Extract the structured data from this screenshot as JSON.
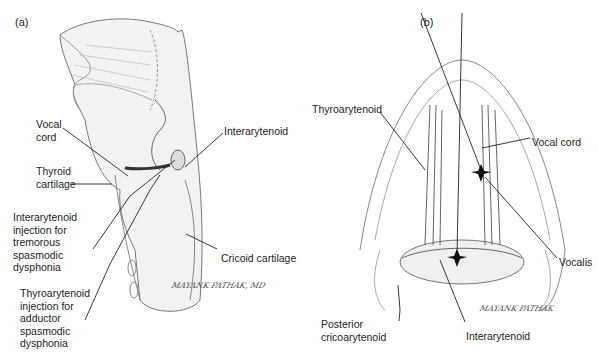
{
  "panels": {
    "a": {
      "label": "(a)",
      "labels": {
        "vocal_cord": [
          "Vocal",
          "cord"
        ],
        "thyroid_cartilage": [
          "Thyroid",
          "cartilage"
        ],
        "interarytenoid": "Interarytenoid",
        "interarytenoid_injection": [
          "Interarytenoid",
          "injection for",
          "tremorous",
          "spasmodic",
          "dysphonia"
        ],
        "thyroarytenoid_injection": [
          "Thyroarytenoid",
          "injection for",
          "adductor",
          "spasmodic",
          "dysphonia"
        ],
        "cricoid_cartilage": "Cricoid cartilage"
      },
      "signature": "MAYANK PATHAK, MD"
    },
    "b": {
      "label": "(b)",
      "labels": {
        "thyroarytenoid": "Thyroarytenoid",
        "vocal_cord": "Vocal cord",
        "vocalis": "Vocalis",
        "posterior_cricoarytenoid": [
          "Posterior",
          "cricoarytenoid"
        ],
        "interarytenoid": "Interarytenoid"
      },
      "signature": "MAYANK PATHAK"
    }
  }
}
